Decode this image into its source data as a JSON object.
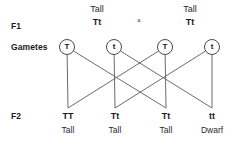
{
  "diagram": {
    "line_color": "#6b6b6b",
    "text_color": "#1a1a1a",
    "circle_stroke": "#4a4a4a"
  },
  "row_labels": {
    "f1": "F1",
    "gametes": "Gametes",
    "f2": "F2"
  },
  "parents": {
    "cross_symbol": "×",
    "left": {
      "phenotype": "Tall",
      "genotype": "Tt"
    },
    "right": {
      "phenotype": "Tall",
      "genotype": "Tt"
    }
  },
  "gametes": [
    {
      "allele": "T",
      "x": 67,
      "y": 47
    },
    {
      "allele": "t",
      "x": 114,
      "y": 47
    },
    {
      "allele": "T",
      "x": 165,
      "y": 47
    },
    {
      "allele": "t",
      "x": 212,
      "y": 47
    }
  ],
  "f2": [
    {
      "genotype": "TT",
      "phenotype": "Tall",
      "x": 68
    },
    {
      "genotype": "Tt",
      "phenotype": "Tall",
      "x": 115
    },
    {
      "genotype": "Tt",
      "phenotype": "Tall",
      "x": 166
    },
    {
      "genotype": "tt",
      "phenotype": "Dwarf",
      "x": 212
    }
  ],
  "connections": [
    {
      "from_gamete": 0,
      "to_f2": 0
    },
    {
      "from_gamete": 0,
      "to_f2": 2
    },
    {
      "from_gamete": 1,
      "to_f2": 1
    },
    {
      "from_gamete": 1,
      "to_f2": 3
    },
    {
      "from_gamete": 2,
      "to_f2": 0
    },
    {
      "from_gamete": 2,
      "to_f2": 2
    },
    {
      "from_gamete": 3,
      "to_f2": 1
    },
    {
      "from_gamete": 3,
      "to_f2": 3
    }
  ]
}
